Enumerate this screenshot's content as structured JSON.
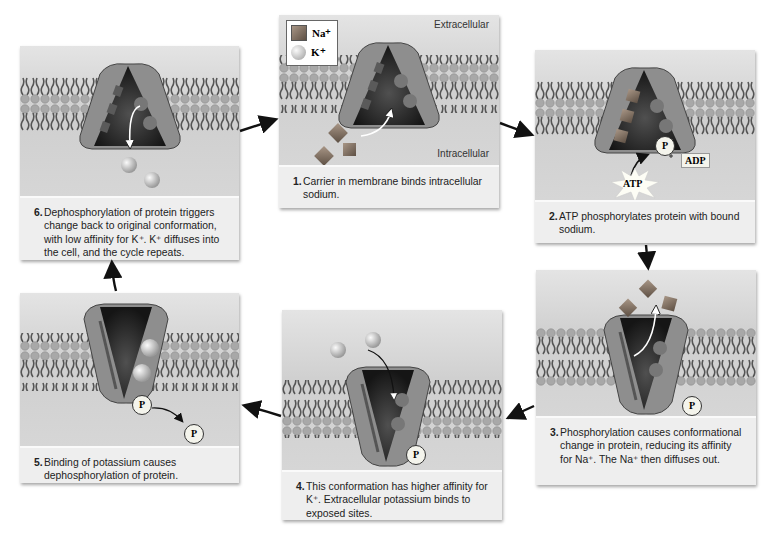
{
  "legend": {
    "items": [
      {
        "symbol": "square",
        "label": "Na⁺",
        "color": "#8a7a6a"
      },
      {
        "symbol": "circle",
        "label": "K⁺",
        "color": "#cfcfcf"
      }
    ]
  },
  "labels": {
    "extracellular": "Extracellular",
    "intracellular": "Intracellular",
    "atp": "ATP",
    "adp": "ADP",
    "phosphate": "P",
    "plus": "+"
  },
  "steps": [
    {
      "number": "1.",
      "text": "Carrier in membrane binds intracellular sodium."
    },
    {
      "number": "2.",
      "text": "ATP phosphorylates protein with bound sodium."
    },
    {
      "number": "3.",
      "text": "Phosphorylation causes conformational change in protein, reducing its affinity for Na⁺. The Na⁺ then diffuses out."
    },
    {
      "number": "4.",
      "text": "This conformation has higher affinity for K⁺. Extracellular potassium binds to exposed sites."
    },
    {
      "number": "5.",
      "text": "Binding of potassium causes dephosphorylation of protein."
    },
    {
      "number": "6.",
      "text": "Dephosphorylation of protein triggers change back to original conformation, with low affinity for K⁺. K⁺ diffuses into the cell, and the cycle repeats."
    }
  ],
  "colors": {
    "protein_outer": "#8e8e8e",
    "protein_inner": "#2a2a2a",
    "membrane_head": "#a9a9a9",
    "sodium": "#7d6e62",
    "potassium": "#d8d8d8",
    "arrow": "#111111"
  }
}
